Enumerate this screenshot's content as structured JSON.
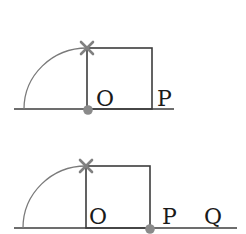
{
  "colors": {
    "line": "#3c3c3c",
    "arc": "#7a7a7a",
    "cross": "#808080",
    "dot": "#8a8a8a",
    "text": "#1a1a1a"
  },
  "figures": [
    {
      "id": "top",
      "labels": {
        "o": "O",
        "p": "P"
      },
      "marker_at": "O"
    },
    {
      "id": "bottom",
      "labels": {
        "o": "O",
        "p": "P",
        "q": "Q"
      },
      "marker_at": "P"
    }
  ]
}
